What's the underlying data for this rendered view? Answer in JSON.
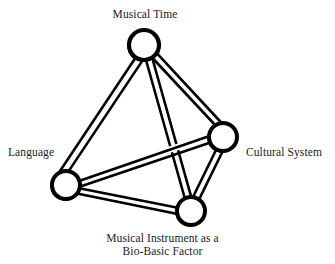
{
  "figure": {
    "kind": "tetrahedron-relationship-diagram",
    "background_color": "#ffffff",
    "stroke_color": "#000000",
    "node_fill_color": "#ffffff"
  },
  "nodes": [
    {
      "id": "musical-time",
      "label": "Musical Time",
      "cx": 144,
      "cy": 45,
      "r": 15
    },
    {
      "id": "cultural-system",
      "label": "Cultural System",
      "cx": 223,
      "cy": 137,
      "r": 14
    },
    {
      "id": "language",
      "label": "Language",
      "cx": 66,
      "cy": 185,
      "r": 14
    },
    {
      "id": "instrument",
      "label_line1": "Musical Instrument as a",
      "label_line2": "Bio-Basic Factor",
      "cx": 191,
      "cy": 211,
      "r": 14
    }
  ],
  "edges": [
    {
      "from": "musical-time",
      "to": "language"
    },
    {
      "from": "musical-time",
      "to": "cultural-system"
    },
    {
      "from": "musical-time",
      "to": "instrument"
    },
    {
      "from": "language",
      "to": "instrument"
    },
    {
      "from": "cultural-system",
      "to": "instrument"
    },
    {
      "from": "language",
      "to": "cultural-system"
    }
  ],
  "labels": {
    "musical_time": "Musical Time",
    "language": "Language",
    "cultural_system": "Cultural System",
    "instrument_line1": "Musical Instrument as a",
    "instrument_line2": "Bio-Basic Factor"
  }
}
